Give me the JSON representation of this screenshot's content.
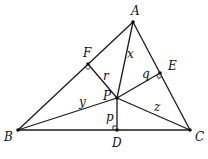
{
  "diagram": {
    "type": "triangle with interior point and perpendiculars",
    "vertices": {
      "A": "A",
      "B": "B",
      "C": "C"
    },
    "feet": {
      "D": "D",
      "E": "E",
      "F": "F"
    },
    "interior_point": "P",
    "segment_labels": {
      "PA": "x",
      "PB": "y",
      "PC": "z",
      "PD": "p",
      "PE": "q",
      "PF": "r"
    },
    "right_angles": [
      "D",
      "E",
      "F"
    ]
  }
}
